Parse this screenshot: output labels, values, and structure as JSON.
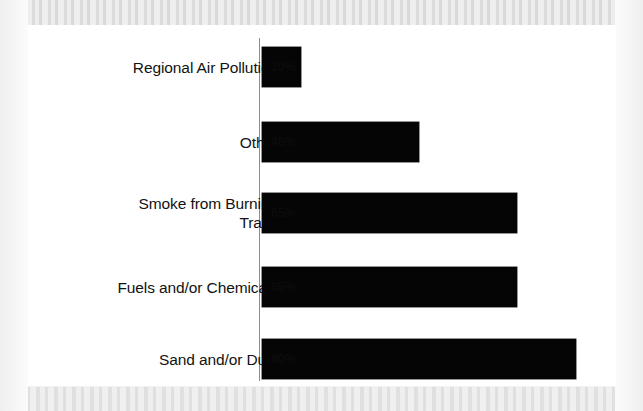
{
  "figure": {
    "background_color": "#f1f1f1",
    "canvas_color": "#ffffff",
    "bar_color": "#050505",
    "axis_color": "#8c8c8c",
    "text_color": "#121212"
  },
  "chart_data": {
    "type": "bar",
    "orientation": "horizontal",
    "title": "",
    "subtitle": "",
    "xlabel": "",
    "ylabel": "",
    "xlim": [
      0,
      100
    ],
    "grid": false,
    "legend": false,
    "axis_visible": {
      "x": false,
      "y": true
    },
    "categories": [
      "Regional Air Pollution",
      "Other",
      "Smoke from Burning\nTrash",
      "Fuels and/or Chemicals",
      "Sand and/or Dust"
    ],
    "values": [
      10,
      40,
      65,
      65,
      80
    ],
    "value_labels": [
      "10%",
      "40%",
      "65%",
      "65%",
      "80%"
    ],
    "units": "percent"
  },
  "rows": [
    {
      "label": "Regional Air Pollution",
      "value": 10,
      "value_label": "10%"
    },
    {
      "label": "Other",
      "value": 40,
      "value_label": "40%"
    },
    {
      "label": "Smoke from Burning\nTrash",
      "value": 65,
      "value_label": "65%"
    },
    {
      "label": "Fuels and/or Chemicals",
      "value": 65,
      "value_label": "65%"
    },
    {
      "label": "Sand and/or Dust",
      "value": 80,
      "value_label": "80%"
    }
  ]
}
